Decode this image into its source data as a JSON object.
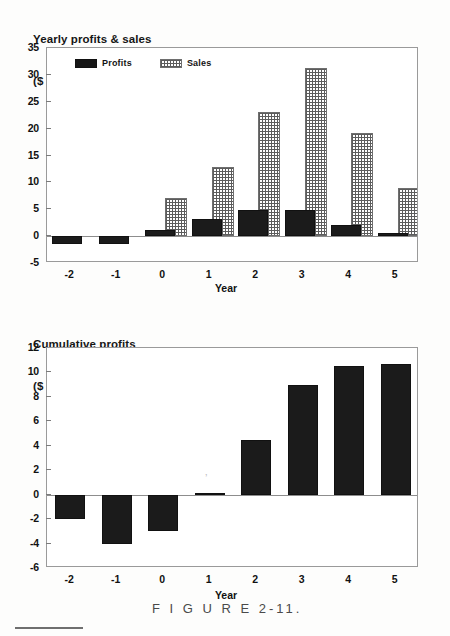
{
  "figure": {
    "caption": "F I G U R E    2-11.",
    "caption_plain": "FIGURE 2-11."
  },
  "charts": [
    {
      "id": "yearly-profits-sales",
      "title_line1": "Yearly profits & sales",
      "title_line2": "($ millions)",
      "xlabel": "Year",
      "legend": [
        {
          "key": "profits",
          "label": "Profits",
          "color": "#161616",
          "fill": "solid-black"
        },
        {
          "key": "sales",
          "label": "Sales",
          "color": "#5c5c5c",
          "fill": "dotted-grid"
        }
      ],
      "yticks": [
        "35",
        "30",
        "25",
        "20",
        "15",
        "10",
        "5",
        "0",
        "-5"
      ],
      "xticks": [
        "-2",
        "-1",
        "0",
        "1",
        "2",
        "3",
        "4",
        "5"
      ]
    },
    {
      "id": "cumulative-profits",
      "title_line1": "Cumulative profits",
      "title_line2": "($ millions)",
      "xlabel": "Year",
      "yticks": [
        "12",
        "10",
        "8",
        "6",
        "4",
        "2",
        "0",
        "-2",
        "-4",
        "-6"
      ],
      "xticks": [
        "-2",
        "-1",
        "0",
        "1",
        "2",
        "3",
        "4",
        "5"
      ]
    }
  ],
  "chart_data": [
    {
      "type": "bar",
      "id": "yearly-profits-sales",
      "title": "Yearly profits & sales ($ millions)",
      "xlabel": "Year",
      "ylabel": "$ millions",
      "categories": [
        "-2",
        "-1",
        "0",
        "1",
        "2",
        "3",
        "4",
        "5"
      ],
      "series": [
        {
          "name": "Profits",
          "values": [
            -1.5,
            -1.5,
            1.2,
            3.2,
            4.8,
            4.8,
            2.1,
            0.5
          ]
        },
        {
          "name": "Sales",
          "values": [
            0,
            0,
            7.1,
            12.9,
            23.1,
            31.3,
            19.1,
            9.0
          ]
        }
      ],
      "ylim": [
        -5,
        35
      ],
      "ytick_step": 5,
      "grid": false,
      "legend_position": "top-left"
    },
    {
      "type": "bar",
      "id": "cumulative-profits",
      "title": "Cumulative profits ($ millions)",
      "xlabel": "Year",
      "ylabel": "$ millions",
      "categories": [
        "-2",
        "-1",
        "0",
        "1",
        "2",
        "3",
        "4",
        "5"
      ],
      "values": [
        -2.0,
        -4.0,
        -3.0,
        0.1,
        4.5,
        9.0,
        10.5,
        10.7
      ],
      "ylim": [
        -6,
        12
      ],
      "ytick_step": 2,
      "grid": false,
      "legend_position": "none"
    }
  ]
}
